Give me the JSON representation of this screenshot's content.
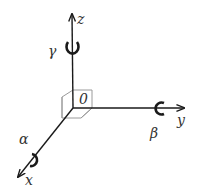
{
  "diagram": {
    "type": "3d-coordinate-axes",
    "origin_label": "0",
    "axes": [
      {
        "name": "x",
        "label": "x",
        "rotation_label": "α"
      },
      {
        "name": "y",
        "label": "y",
        "rotation_label": "β"
      },
      {
        "name": "z",
        "label": "z",
        "rotation_label": "γ"
      }
    ],
    "colors": {
      "axis": "#1a1a1a",
      "cube": "#999999",
      "label": "#333333",
      "background": "#ffffff"
    }
  }
}
